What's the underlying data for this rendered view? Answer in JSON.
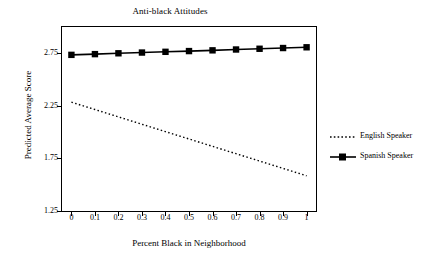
{
  "chart_data": {
    "type": "line",
    "title": "Anti-black Attitudes",
    "xlabel": "Percent Black in Neighborhood",
    "ylabel": "Predicted Average Score",
    "xlim": [
      -0.04,
      1.04
    ],
    "ylim": [
      1.25,
      3.0
    ],
    "xticks": [
      "0",
      "0.1",
      "0.2",
      "0.3",
      "0.4",
      "0.5",
      "0.6",
      "0.7",
      "0.8",
      "0.9",
      "1"
    ],
    "xtick_values": [
      0,
      0.1,
      0.2,
      0.3,
      0.4,
      0.5,
      0.6,
      0.7,
      0.8,
      0.9,
      1
    ],
    "yticks": [
      "1.25",
      "1.75",
      "2.25",
      "2.75"
    ],
    "ytick_values": [
      1.25,
      1.75,
      2.25,
      2.75
    ],
    "grid": false,
    "legend_position": "right",
    "x": [
      0,
      0.1,
      0.2,
      0.3,
      0.4,
      0.5,
      0.6,
      0.7,
      0.8,
      0.9,
      1
    ],
    "series": [
      {
        "name": "English Speaker",
        "style": "dotted",
        "marker": "none",
        "color": "#000000",
        "values": [
          2.285,
          2.215,
          2.145,
          2.075,
          2.005,
          1.935,
          1.865,
          1.795,
          1.725,
          1.655,
          1.585
        ]
      },
      {
        "name": "Spanish Speaker",
        "style": "solid",
        "marker": "square",
        "color": "#000000",
        "values": [
          2.735,
          2.742,
          2.75,
          2.757,
          2.764,
          2.771,
          2.778,
          2.786,
          2.793,
          2.8,
          2.807
        ]
      }
    ]
  },
  "legend": {
    "items": [
      {
        "label": "English Speaker"
      },
      {
        "label": "Spanish Speaker"
      }
    ]
  }
}
